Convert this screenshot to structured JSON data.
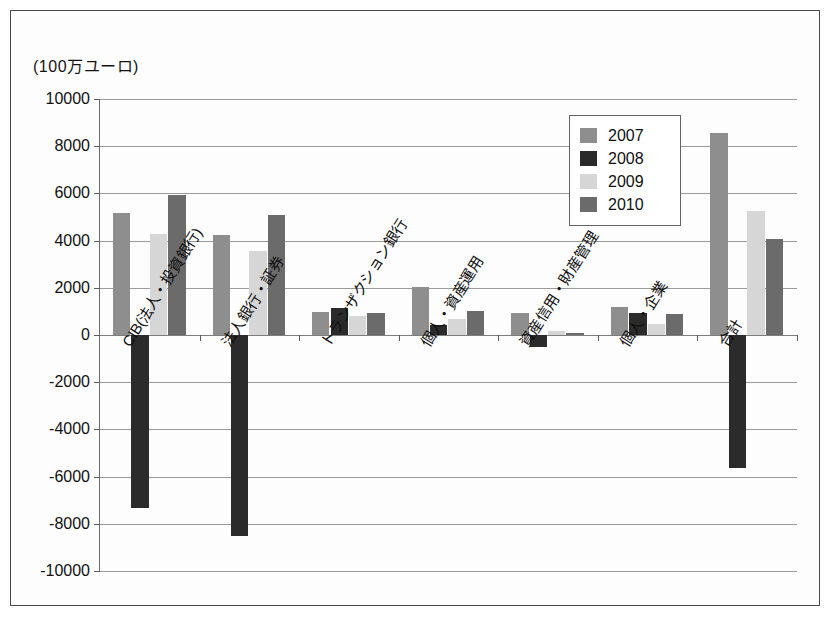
{
  "figure": {
    "unit_caption": "(100万ユーロ)"
  },
  "chart_data": {
    "type": "bar",
    "title": "",
    "subtitle": "",
    "xlabel": "",
    "ylabel": "(100万ユーロ)",
    "ylim": [
      -10000,
      10000
    ],
    "ytick_step": 2000,
    "ytick_labels": [
      "10000",
      "8000",
      "6000",
      "4000",
      "2000",
      "0",
      "-2000",
      "-4000",
      "-6000",
      "-8000",
      "-10000"
    ],
    "ytick_values": [
      10000,
      8000,
      6000,
      4000,
      2000,
      0,
      -2000,
      -4000,
      -6000,
      -8000,
      -10000
    ],
    "grid": true,
    "legend_position": "upper-right-inside",
    "categories": [
      "CIB(法人・投資銀行)",
      "法人銀行・証券",
      "トランザクション銀行",
      "個人・資産運用",
      "資産信用・財産管理",
      "個人・企業",
      "合計"
    ],
    "series": [
      {
        "name": "2007",
        "color": "#8e8e8e",
        "values": [
          5150,
          4250,
          980,
          2020,
          930,
          1180,
          8550
        ]
      },
      {
        "name": "2008",
        "color": "#2b2b2b",
        "values": [
          -7350,
          -8500,
          1150,
          420,
          -500,
          950,
          -5650
        ]
      },
      {
        "name": "2009",
        "color": "#d6d6d6",
        "values": [
          4300,
          3550,
          820,
          680,
          180,
          450,
          5250
        ]
      },
      {
        "name": "2010",
        "color": "#6b6b6b",
        "values": [
          5950,
          5100,
          950,
          1000,
          80,
          900,
          4050
        ]
      }
    ]
  },
  "legend": {
    "items": [
      {
        "label": "2007",
        "color": "#8e8e8e"
      },
      {
        "label": "2008",
        "color": "#2b2b2b"
      },
      {
        "label": "2009",
        "color": "#d6d6d6"
      },
      {
        "label": "2010",
        "color": "#6b6b6b"
      }
    ]
  }
}
